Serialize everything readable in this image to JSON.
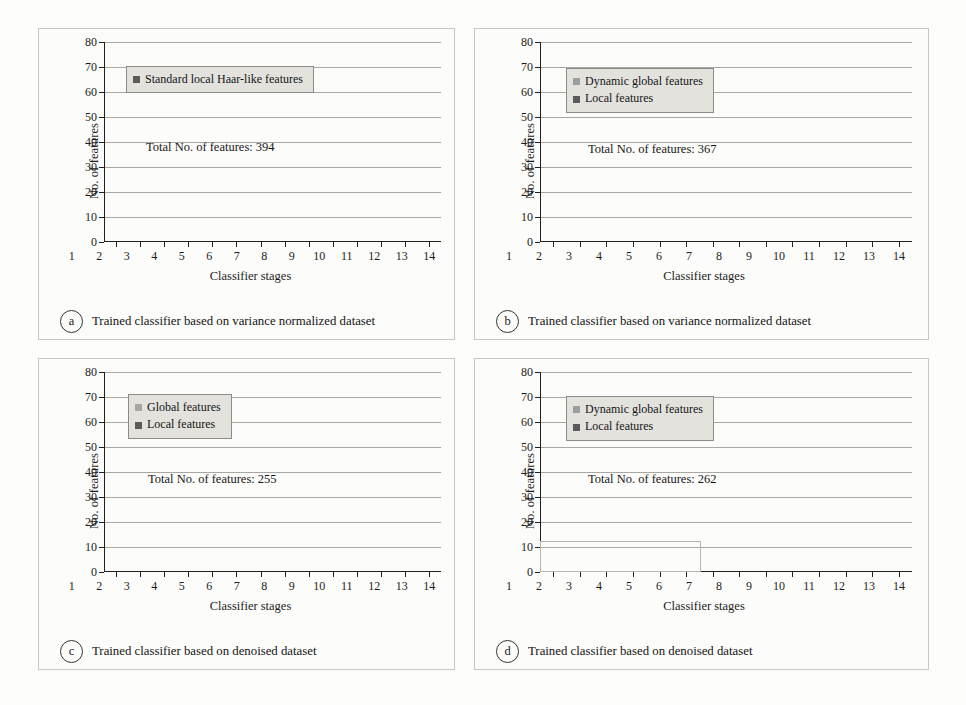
{
  "figure": {
    "background": "#fdfdfb",
    "panel_border": "#c9c7c0",
    "colors": {
      "local": "#5b5b5b",
      "global": "#9a9a9a",
      "light_global": "#a8a8a8",
      "axis": "#202020",
      "gridline": "#a9a7a2",
      "legend_bg": "#e3e2dd"
    }
  },
  "panels": [
    {
      "letter": "a",
      "caption": "Trained classifier based on variance normalized dataset",
      "total_label": "Total No. of features: 394",
      "legend": [
        "Standard local Haar-like features"
      ],
      "chart_data": {
        "type": "bar",
        "title": "",
        "xlabel": "Classifier stages",
        "ylabel": "No. of features",
        "ylim": [
          0,
          80
        ],
        "yticks": [
          0,
          10,
          20,
          30,
          40,
          50,
          60,
          70,
          80
        ],
        "grid": true,
        "legend_position": "upper-left",
        "categories": [
          "1",
          "2",
          "3",
          "4",
          "5",
          "6",
          "7",
          "8",
          "9",
          "10",
          "11",
          "12",
          "13",
          "14"
        ],
        "series": [
          {
            "name": "Standard local Haar-like features",
            "color": "#5b5b5b",
            "values": [
              1.7,
              5.8,
              8.7,
              10.4,
              13.4,
              17.4,
              19.4,
              26.4,
              29.4,
              32.3,
              41.2,
              48.2,
              62.1,
              69.2
            ]
          }
        ]
      }
    },
    {
      "letter": "b",
      "caption": "Trained classifier based on variance normalized dataset",
      "total_label": "Total No. of features: 367",
      "legend": [
        "Dynamic global features",
        "Local features"
      ],
      "chart_data": {
        "type": "bar",
        "stacked": true,
        "title": "",
        "xlabel": "Classifier stages",
        "ylabel": "No. of features",
        "ylim": [
          0,
          80
        ],
        "yticks": [
          0,
          10,
          20,
          30,
          40,
          50,
          60,
          70,
          80
        ],
        "grid": true,
        "legend_position": "upper-left",
        "categories": [
          "1",
          "2",
          "3",
          "4",
          "5",
          "6",
          "7",
          "8",
          "9",
          "10",
          "11",
          "12",
          "13",
          "14"
        ],
        "series": [
          {
            "name": "Local features",
            "color": "#5b5b5b",
            "values": [
              1.7,
              5.8,
              8.7,
              7.8,
              9.2,
              11.8,
              11.2,
              18.0,
              21.0,
              27.5,
              30.0,
              33.0,
              39.0,
              48.0
            ]
          },
          {
            "name": "Dynamic global features",
            "color": "#9a9a9a",
            "values": [
              0.0,
              0.0,
              0.0,
              1.8,
              3.3,
              3.7,
              8.3,
              7.2,
              5.2,
              1.6,
              17.0,
              14.0,
              12.0,
              11.0
            ]
          }
        ],
        "totals": [
          1.7,
          5.8,
          8.7,
          9.6,
          12.5,
          15.5,
          19.5,
          25.2,
          26.2,
          29.1,
          47.0,
          47.0,
          51.0,
          59.0
        ]
      }
    },
    {
      "letter": "c",
      "caption": "Trained classifier based on denoised dataset",
      "total_label": "Total No. of features: 255",
      "legend": [
        "Global features",
        "Local features"
      ],
      "chart_data": {
        "type": "bar",
        "stacked": true,
        "title": "",
        "xlabel": "Classifier stages",
        "ylabel": "No. of features",
        "ylim": [
          0,
          80
        ],
        "yticks": [
          0,
          10,
          20,
          30,
          40,
          50,
          60,
          70,
          80
        ],
        "grid": true,
        "legend_position": "upper-left",
        "categories": [
          "1",
          "2",
          "3",
          "4",
          "5",
          "6",
          "7",
          "8",
          "9",
          "10",
          "11",
          "12",
          "13",
          "14"
        ],
        "series": [
          {
            "name": "Local features",
            "color": "#5b5b5b",
            "values": [
              1.7,
              3.2,
              5.0,
              7.6,
              11.5,
              13.5,
              16.5,
              17.5,
              20.6,
              19.2,
              23.4,
              26.3,
              28.0,
              36.2
            ]
          },
          {
            "name": "Global features",
            "color": "#a8a8a8",
            "values": [
              0.0,
              0.7,
              0.5,
              0.2,
              0.2,
              0.2,
              0.2,
              1.5,
              0.5,
              2.9,
              1.6,
              0.6,
              1.8,
              4.6
            ]
          }
        ],
        "totals": [
          1.7,
          3.9,
          5.5,
          7.8,
          11.7,
          13.7,
          16.7,
          19.0,
          21.1,
          22.1,
          25.0,
          26.9,
          29.8,
          40.8
        ]
      }
    },
    {
      "letter": "d",
      "caption": "Trained classifier based on denoised dataset",
      "total_label": "Total No. of features: 262",
      "legend": [
        "Dynamic global features",
        "Local features"
      ],
      "chart_data": {
        "type": "bar",
        "title": "",
        "xlabel": "Classifier stages",
        "ylabel": "No. of features",
        "ylim": [
          0,
          80
        ],
        "yticks": [
          0,
          10,
          20,
          30,
          40,
          50,
          60,
          70,
          80
        ],
        "grid": true,
        "legend_position": "upper-left",
        "highlight_region": {
          "from_category": "1",
          "to_category": "6",
          "to_value": 11.5
        },
        "categories": [
          "1",
          "2",
          "3",
          "4",
          "5",
          "6",
          "7",
          "8",
          "9",
          "10",
          "11",
          "12",
          "13",
          "14"
        ],
        "series": [
          {
            "name": "Dynamic global features",
            "color": "#9a9a9a",
            "values": [
              1.5,
              3.6,
              4.6,
              6.5,
              10.5,
              10.4,
              0,
              0,
              0,
              0,
              0,
              0,
              0,
              0
            ]
          },
          {
            "name": "Local features",
            "color": "#5b5b5b",
            "values": [
              0,
              0,
              0,
              0,
              0,
              0,
              15.4,
              16.2,
              20.2,
              26.0,
              25.2,
              33.0,
              34.0,
              44.7
            ]
          }
        ],
        "totals": [
          1.5,
          3.6,
          4.6,
          6.5,
          10.5,
          10.4,
          15.4,
          16.2,
          20.2,
          26.0,
          25.2,
          33.0,
          34.0,
          44.7
        ]
      }
    }
  ]
}
